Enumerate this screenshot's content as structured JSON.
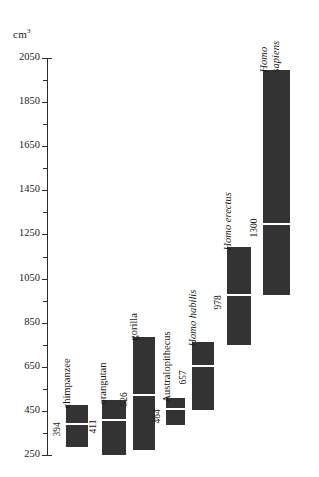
{
  "chart_data": {
    "type": "bar",
    "title": "",
    "subtitle": "",
    "xlabel": "",
    "ylabel": "cm",
    "ylabel_superscript": "3",
    "unit_text": "cm3",
    "ylim": [
      250,
      2050
    ],
    "grid": false,
    "legend": null,
    "orientation": "vertical",
    "y_ticks_major": [
      250,
      450,
      650,
      850,
      1050,
      1250,
      1450,
      1650,
      1850,
      2050
    ],
    "y_ticks_minor": [
      350,
      550,
      750,
      950,
      1150,
      1350,
      1550,
      1750,
      1950
    ],
    "y_tick_labels": [
      "250",
      "450",
      "650",
      "850",
      "1050",
      "1250",
      "1450",
      "1650",
      "1850",
      "2050"
    ],
    "categories": [
      "chimpanzee",
      "orangutan",
      "gorilla",
      "Australopithecus",
      "Homo habilis",
      "Homo erectus",
      "Homo sapiens"
    ],
    "series": [
      {
        "name": "brain volume range (cm3)",
        "bars": [
          {
            "category": "chimpanzee",
            "label": "chimpanzee",
            "label_italic": false,
            "mean": 394,
            "mean_label": "394",
            "range_low": 287,
            "range_high": 477
          },
          {
            "category": "orangutan",
            "label": "orangutan",
            "label_italic": false,
            "mean": 411,
            "mean_label": "411",
            "range_low": 252,
            "range_high": 500
          },
          {
            "category": "gorilla",
            "label": "gorilla",
            "label_italic": false,
            "mean": 526,
            "mean_label": "526",
            "range_low": 272,
            "range_high": 785
          },
          {
            "category": "Australopithecus",
            "label": "Australopithecus",
            "label_italic": false,
            "mean": 464,
            "mean_label": "464",
            "range_low": 385,
            "range_high": 508
          },
          {
            "category": "Homo habilis",
            "label": "Homo habilis",
            "label_italic": true,
            "mean": 657,
            "mean_label": "657",
            "range_low": 454,
            "range_high": 762
          },
          {
            "category": "Homo erectus",
            "label": "Homo erectus",
            "label_italic": true,
            "mean": 978,
            "mean_label": "978",
            "range_low": 748,
            "range_high": 1193
          },
          {
            "category": "Homo sapiens",
            "label": "Homo sapiens",
            "label_line1": "Homo",
            "label_line2": "sapiens",
            "label_italic": true,
            "mean": 1300,
            "mean_label": "1300",
            "range_low": 978,
            "range_high": 1996
          }
        ]
      }
    ],
    "colors": {
      "bar": "#333333",
      "split_line": "#ffffff",
      "axis": "#2b2b2b",
      "text": "#1a1a1a",
      "background": "#ffffff"
    }
  },
  "axis": {
    "unit_prefix": "cm",
    "unit_exponent": "3"
  }
}
